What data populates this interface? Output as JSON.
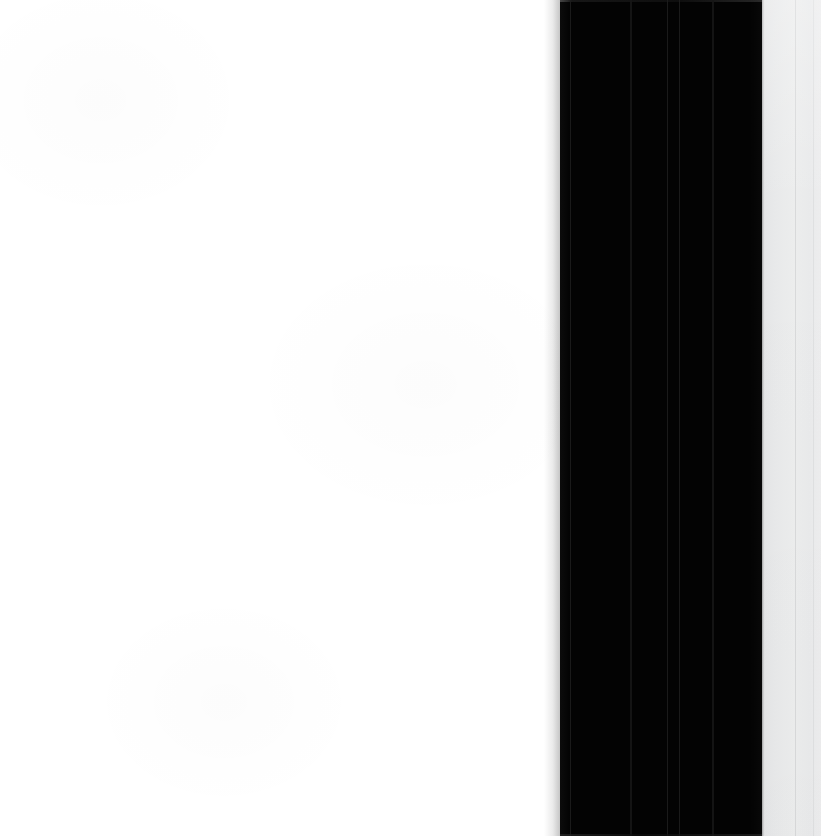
{
  "view": {
    "title": "Zoomed UI Region",
    "description": "Extreme magnification of a user interface edge: a blank white content field, a solid black vertical panel with faint internal seams, and a light gray side panel with a thin vertical divider.",
    "width_px": 821,
    "height_px": 836,
    "visible_text": ""
  },
  "regions": [
    {
      "id": "white-field",
      "name": "Blank white content area",
      "role": "content-surface",
      "color": "#ffffff",
      "x": 0,
      "y": 0,
      "width": 560,
      "height": 836,
      "text": ""
    },
    {
      "id": "black-band",
      "name": "Solid black vertical panel",
      "role": "panel-surface",
      "color": "#030303",
      "x": 560,
      "y": 0,
      "width": 202,
      "height": 836,
      "text": ""
    },
    {
      "id": "gray-panel",
      "name": "Light gray side panel",
      "role": "panel-surface",
      "color": "#e9eaeb",
      "x": 762,
      "y": 0,
      "width": 59,
      "height": 836,
      "text": ""
    }
  ],
  "seams": {
    "label": "Faint vertical seams inside the black panel",
    "color": "#1d1d1d",
    "positions_px": [
      570,
      630,
      667,
      679,
      712
    ]
  },
  "dividers": {
    "label": "Vertical divider lines in the gray panel",
    "color": "#d8d9da",
    "positions_px": [
      795,
      813
    ]
  },
  "edges": {
    "white_to_black_px": 560,
    "black_to_gray_px": 762,
    "band_top_rim_color": "#2c2c2c",
    "gray_left_hairline_color": "#282828"
  },
  "colors": {
    "white": "#ffffff",
    "black": "#030303",
    "gray_light": "#ececed",
    "gray_mid": "#e4e5e6",
    "divider": "#d8d9da",
    "seam": "#1d1d1d"
  }
}
